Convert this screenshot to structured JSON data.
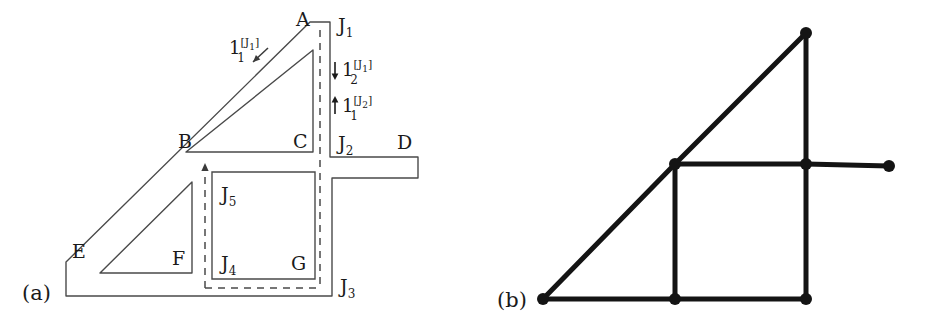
{
  "figure": {
    "background_color": "#ffffff",
    "line_color": "#3a3a3a",
    "node_color": "#141414",
    "edge_color": "#141414",
    "panels": [
      {
        "id": "a",
        "caption": "(a)",
        "description": "wire-frame outline of an L/triangle shaped region with interior triangles, an inner square, dashed flux paths and labelled corners"
      },
      {
        "id": "b",
        "caption": "(b)",
        "description": "skeleton graph of the region in panel (a) with filled circular nodes joined by thick straight edges"
      }
    ]
  },
  "panel_a": {
    "caption": "(a)",
    "corner_labels": [
      {
        "key": "A",
        "text": "A",
        "x": 296,
        "y": 26
      },
      {
        "key": "B",
        "text": "B",
        "x": 178,
        "y": 148
      },
      {
        "key": "C",
        "text": "C",
        "x": 293,
        "y": 148
      },
      {
        "key": "D",
        "text": "D",
        "x": 397,
        "y": 149
      },
      {
        "key": "E",
        "text": "E",
        "x": 72,
        "y": 258
      },
      {
        "key": "F",
        "text": "F",
        "x": 172,
        "y": 265
      },
      {
        "key": "G",
        "text": "G",
        "x": 291,
        "y": 270
      }
    ],
    "junction_labels": [
      {
        "key": "J1",
        "base": "J",
        "sub": "1",
        "x": 338,
        "y": 32
      },
      {
        "key": "J2",
        "base": "J",
        "sub": "2",
        "x": 338,
        "y": 150
      },
      {
        "key": "J3",
        "base": "J",
        "sub": "3",
        "x": 340,
        "y": 293
      },
      {
        "key": "J4",
        "base": "J",
        "sub": "4",
        "x": 221,
        "y": 270
      },
      {
        "key": "J5",
        "base": "J",
        "sub": "5",
        "x": 221,
        "y": 201
      }
    ],
    "flux_labels": [
      {
        "key": "l1-J1",
        "arrow": "none",
        "base": "1",
        "sub": "1",
        "sup": "[J",
        "sup_sub": "1",
        "sup_close": "]",
        "text_plain": "1_1^[J_1]",
        "x": 229,
        "y": 54
      },
      {
        "key": "l2-J1",
        "arrow": "down",
        "base": "1",
        "sub": "2",
        "sup": "[J",
        "sup_sub": "1",
        "sup_close": "]",
        "text_plain": "1_2^[J_1]",
        "x": 342,
        "y": 76
      },
      {
        "key": "l1-J2",
        "arrow": "up",
        "base": "1",
        "sub": "1",
        "sup": "[J",
        "sup_sub": "2",
        "sup_close": "]",
        "text_plain": "1_1^[J_2]",
        "x": 342,
        "y": 112
      }
    ],
    "geometry": {
      "outer_outline": "M 66,296 L 66,262 L 310,22 L 330,22 L 330,157 L 418,157 L 418,178 L 332,178 L 332,296 Z",
      "inner_triangle_upper": "M 186,152 L 313,152 L 313,50 Z",
      "inner_triangle_lower": "M 100,273 L 192,273 L 192,182 Z",
      "inner_square": "M 212,172 L 315,172 L 315,279 L 212,279 Z",
      "dashed_vertical": {
        "x": 320,
        "y1": 30,
        "y2": 288
      },
      "dashed_horizontal": {
        "y": 288,
        "x1": 205,
        "x2": 320
      },
      "dashed_arrow_up": {
        "x": 205,
        "y1": 288,
        "y2": 168
      },
      "small_arrow_to_edge": {
        "x1": 268,
        "y1": 48,
        "x2": 253,
        "y2": 62
      }
    }
  },
  "panel_b": {
    "caption": "(b)",
    "nodes": [
      {
        "id": "n-apex",
        "x": 806,
        "y": 33
      },
      {
        "id": "n-mid-left",
        "x": 675,
        "y": 164
      },
      {
        "id": "n-mid-right",
        "x": 806,
        "y": 164
      },
      {
        "id": "n-far-right",
        "x": 889,
        "y": 166
      },
      {
        "id": "n-bottom-left",
        "x": 543,
        "y": 299
      },
      {
        "id": "n-bottom-mid",
        "x": 675,
        "y": 299
      },
      {
        "id": "n-bottom-right",
        "x": 806,
        "y": 299
      }
    ],
    "edges": [
      {
        "from": "n-bottom-left",
        "to": "n-mid-left"
      },
      {
        "from": "n-mid-left",
        "to": "n-apex"
      },
      {
        "from": "n-apex",
        "to": "n-mid-right"
      },
      {
        "from": "n-mid-left",
        "to": "n-mid-right"
      },
      {
        "from": "n-mid-right",
        "to": "n-far-right"
      },
      {
        "from": "n-mid-left",
        "to": "n-bottom-mid"
      },
      {
        "from": "n-mid-right",
        "to": "n-bottom-right"
      },
      {
        "from": "n-bottom-left",
        "to": "n-bottom-mid"
      },
      {
        "from": "n-bottom-mid",
        "to": "n-bottom-right"
      }
    ],
    "node_radius": 6,
    "edge_width": 5,
    "caption_x": 497,
    "caption_y": 305
  }
}
